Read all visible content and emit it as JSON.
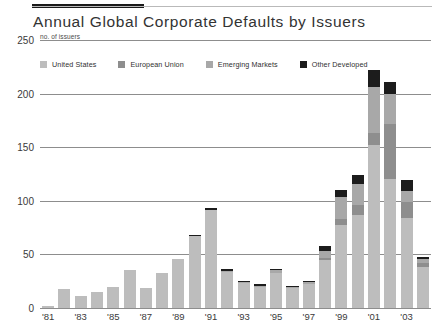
{
  "header": {
    "title": "Annual Global Corporate Defaults by Issuers",
    "unit_label": "no. of issuers"
  },
  "legend": {
    "position": "top-left-inside",
    "items": [
      {
        "label": "United States",
        "color": "#bdbdbd",
        "key": "us"
      },
      {
        "label": "European Union",
        "color": "#8e8e8e",
        "key": "eu"
      },
      {
        "label": "Emerging Markets",
        "color": "#a8a8a8",
        "key": "em"
      },
      {
        "label": "Other Developed",
        "color": "#1c1c1c",
        "key": "od"
      }
    ]
  },
  "chart_data": {
    "type": "bar",
    "stacked": true,
    "title": "Annual Global Corporate Defaults by Issuers",
    "subtitle": "",
    "xlabel": "",
    "ylabel": "no. of issuers",
    "ylim": [
      0,
      250
    ],
    "yticks": [
      0,
      50,
      100,
      150,
      200,
      250
    ],
    "ytick_labels": [
      "0",
      "50",
      "100",
      "150",
      "200",
      "250"
    ],
    "grid": "horizontal",
    "categories": [
      "'81",
      "'82",
      "'83",
      "'84",
      "'85",
      "'86",
      "'87",
      "'88",
      "'89",
      "'90",
      "'91",
      "'92",
      "'93",
      "'94",
      "'95",
      "'96",
      "'97",
      "'98",
      "'99",
      "'00",
      "'01",
      "'02",
      "'03",
      "'04"
    ],
    "xtick_labels_shown": [
      "'81",
      "'83",
      "'85",
      "'87",
      "'89",
      "'91",
      "'93",
      "'95",
      "'97",
      "'99",
      "'01",
      "'03"
    ],
    "series": [
      {
        "name": "United States",
        "color": "#bdbdbd",
        "values": [
          2,
          18,
          11,
          15,
          20,
          35,
          19,
          33,
          46,
          67,
          91,
          34,
          23,
          20,
          33,
          19,
          22,
          45,
          77,
          87,
          152,
          120,
          84,
          38
        ]
      },
      {
        "name": "European Union",
        "color": "#8e8e8e",
        "values": [
          0,
          0,
          0,
          0,
          0,
          0,
          0,
          0,
          0,
          0,
          0,
          0,
          0,
          0,
          0,
          0,
          0,
          2,
          6,
          9,
          11,
          52,
          15,
          4
        ]
      },
      {
        "name": "Emerging Markets",
        "color": "#a8a8a8",
        "values": [
          0,
          0,
          0,
          0,
          0,
          0,
          0,
          0,
          0,
          0,
          0,
          1,
          1,
          1,
          2,
          1,
          2,
          6,
          21,
          20,
          43,
          28,
          10,
          4
        ]
      },
      {
        "name": "Other Developed",
        "color": "#1c1c1c",
        "values": [
          0,
          0,
          0,
          0,
          0,
          0,
          0,
          0,
          0,
          1,
          2,
          1,
          1,
          1,
          1,
          1,
          1,
          5,
          6,
          8,
          16,
          11,
          10,
          2
        ]
      }
    ],
    "totals": [
      2,
      18,
      11,
      15,
      20,
      35,
      19,
      33,
      46,
      68,
      93,
      36,
      25,
      22,
      36,
      21,
      25,
      58,
      110,
      124,
      222,
      211,
      119,
      48
    ]
  },
  "colors": {
    "gridline": "#8d8d8d",
    "rule": "#b9b9b9",
    "accent_rule": "#1a1a1a",
    "text": "#2b2b2b",
    "background": "#ffffff"
  }
}
